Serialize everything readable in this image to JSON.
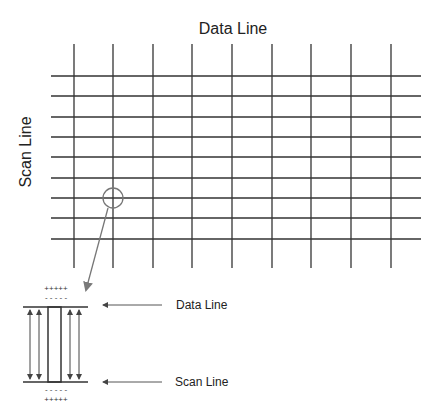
{
  "diagram": {
    "title": "Data Line",
    "side_label": "Scan Line",
    "grid": {
      "vertical_lines_x": [
        74,
        113,
        153,
        192,
        232,
        272,
        311,
        351,
        391
      ],
      "vertical_top": 44,
      "vertical_bottom": 268,
      "horizontal_lines_y": [
        76,
        96,
        117,
        137,
        157,
        178,
        198,
        218,
        239
      ],
      "horizontal_left": 51,
      "horizontal_right": 421,
      "line_color": "#333333"
    },
    "highlight": {
      "cx": 113,
      "cy": 198,
      "r": 10,
      "color": "#777777"
    },
    "pointer_arrow": {
      "x1": 108,
      "y1": 208,
      "x2": 86,
      "y2": 290,
      "color": "#777777"
    },
    "detail": {
      "top_plus": "+++++",
      "top_minus": "- - - - -",
      "bottom_minus": "- - - - -",
      "bottom_plus": "+++++",
      "data_line_label": "Data Line",
      "scan_line_label": "Scan Line"
    }
  }
}
